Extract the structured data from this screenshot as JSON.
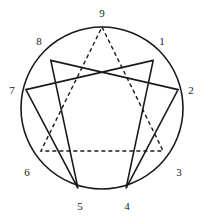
{
  "diagram": {
    "name": "enneagram-symbol",
    "background_color": "#ffffff",
    "stroke_color": "#1a1a1a",
    "circle": {
      "cx": 102,
      "cy": 108,
      "r": 81,
      "stroke_width": 1.6,
      "style": "solid"
    },
    "points": [
      {
        "number": "1",
        "x": 153.2,
        "y": 60.4,
        "label_x": 162,
        "label_y": 41
      },
      {
        "number": "2",
        "x": 178.1,
        "y": 89.6,
        "label_x": 191,
        "label_y": 90
      },
      {
        "number": "3",
        "x": 163.1,
        "y": 151.0,
        "label_x": 179,
        "label_y": 172
      },
      {
        "number": "4",
        "x": 126.0,
        "y": 188.4,
        "label_x": 127,
        "label_y": 206
      },
      {
        "number": "5",
        "x": 78.0,
        "y": 188.4,
        "label_x": 80,
        "label_y": 206
      },
      {
        "number": "6",
        "x": 40.9,
        "y": 151.0,
        "label_x": 27,
        "label_y": 172
      },
      {
        "number": "7",
        "x": 25.9,
        "y": 89.6,
        "label_x": 12,
        "label_y": 90
      },
      {
        "number": "8",
        "x": 50.8,
        "y": 60.4,
        "label_x": 39,
        "label_y": 41
      },
      {
        "number": "9",
        "x": 102.0,
        "y": 27.0,
        "label_x": 102,
        "label_y": 13
      }
    ],
    "triangle": {
      "name": "inner-triangle",
      "style": "dashed",
      "dash_pattern": "4,3",
      "stroke_width": 1.4,
      "sequence": [
        "9",
        "3",
        "6",
        "9"
      ]
    },
    "hexad": {
      "name": "hexad-figure",
      "style": "solid",
      "stroke_width": 1.6,
      "sequence": [
        "1",
        "4",
        "2",
        "8",
        "5",
        "7",
        "1"
      ]
    }
  }
}
